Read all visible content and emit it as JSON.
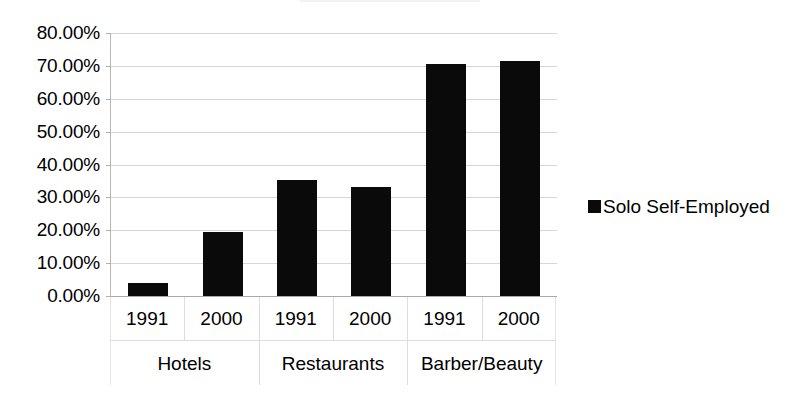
{
  "chart_data": {
    "type": "bar",
    "title": "",
    "subtitle": "",
    "xlabel": "",
    "ylabel": "",
    "ylim": [
      0,
      80
    ],
    "ytick_values": [
      80,
      70,
      60,
      50,
      40,
      30,
      20,
      10,
      0
    ],
    "ytick_labels": [
      "80.00%",
      "70.00%",
      "60.00%",
      "50.00%",
      "40.00%",
      "30.00%",
      "20.00%",
      "10.00%",
      "0.00%"
    ],
    "grid": true,
    "legend_position": "right",
    "legend": [
      "Solo Self-Employed"
    ],
    "groups": [
      "Hotels",
      "Restaurants",
      "Barber/Beauty"
    ],
    "subcategories": [
      "1991",
      "2000"
    ],
    "categories": [
      "Hotels 1991",
      "Hotels 2000",
      "Restaurants 1991",
      "Restaurants 2000",
      "Barber/Beauty 1991",
      "Barber/Beauty 2000"
    ],
    "series": [
      {
        "name": "Solo Self-Employed",
        "color": "#0a0a0a",
        "values": [
          4.0,
          19.5,
          35.2,
          33.3,
          70.5,
          71.5
        ]
      }
    ],
    "bars": [
      {
        "group": "Hotels",
        "year": "1991",
        "value": 4.0
      },
      {
        "group": "Hotels",
        "year": "2000",
        "value": 19.5
      },
      {
        "group": "Restaurants",
        "year": "1991",
        "value": 35.2
      },
      {
        "group": "Restaurants",
        "year": "2000",
        "value": 33.3
      },
      {
        "group": "Barber/Beauty",
        "year": "1991",
        "value": 70.5
      },
      {
        "group": "Barber/Beauty",
        "year": "2000",
        "value": 71.5
      }
    ]
  },
  "axis": {
    "year_cells": [
      "1991",
      "2000",
      "1991",
      "2000",
      "1991",
      "2000"
    ],
    "group_cells": [
      "Hotels",
      "Restaurants",
      "Barber/Beauty"
    ]
  },
  "legend": {
    "marker_name": "legend-swatch-solo-self-employed",
    "label": "Solo Self-Employed",
    "color": "#0a0a0a"
  },
  "style": {
    "bar_color": "#0a0a0a",
    "gridline_color": "#d6d6d6",
    "axis_color": "#a8a8a8",
    "background": "#ffffff"
  }
}
